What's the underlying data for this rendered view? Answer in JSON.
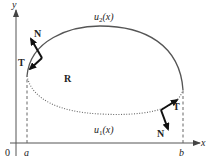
{
  "figure": {
    "axes": {
      "x_label": "x",
      "y_label": "y",
      "origin_label": "0",
      "a_label": "a",
      "b_label": "b"
    },
    "curves": {
      "upper_label_u": "u",
      "upper_label_sub": "2",
      "upper_label_arg": "(x)",
      "lower_label_u": "u",
      "lower_label_sub": "1",
      "lower_label_arg": "(x)"
    },
    "region_label": "R",
    "vectors": {
      "left_tangent": "T",
      "left_normal": "N",
      "right_tangent": "T",
      "right_normal": "N"
    },
    "colors": {
      "axis": "#555555",
      "upper_curve": "#555555",
      "lower_curve": "#555555",
      "vector": "#111111"
    }
  }
}
